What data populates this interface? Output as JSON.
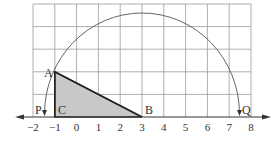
{
  "diagram": {
    "type": "number-line-construction",
    "axis": {
      "ticks": [
        "−2",
        "−1",
        "0",
        "1",
        "2",
        "3",
        "4",
        "5",
        "6",
        "7",
        "8"
      ],
      "min": -2,
      "max": 8
    },
    "grid": {
      "columns": 10,
      "rows": 5
    },
    "points": {
      "A": {
        "label": "A",
        "x": -1,
        "y": 2
      },
      "B": {
        "label": "B",
        "x": 3,
        "y": 0
      },
      "C": {
        "label": "C",
        "x": -1,
        "y": 0
      },
      "P": {
        "label": "P",
        "x": -1.47,
        "y": 0
      },
      "Q": {
        "label": "Q",
        "x": 7.47,
        "y": 0
      }
    },
    "triangle": {
      "vertices": [
        "A",
        "C",
        "B"
      ],
      "fill": "#c8c8c8"
    },
    "arc": {
      "center": "B",
      "radius_through": "A",
      "from": "P",
      "to": "Q"
    },
    "colors": {
      "grid": "#9a9a9a",
      "line": "#333333",
      "shade": "#c8c8c8"
    }
  }
}
